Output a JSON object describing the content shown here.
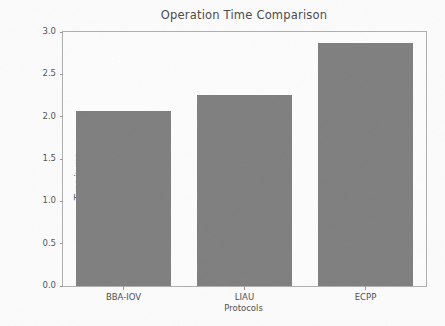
{
  "chart_data": {
    "type": "bar",
    "title": "Operation Time Comparison",
    "xlabel": "Protocols",
    "ylabel": "Time in ms",
    "categories": [
      "BBA-IOV",
      "LIAU",
      "ECPP"
    ],
    "values": [
      2.07,
      2.26,
      2.87
    ],
    "ylim": [
      0.0,
      3.0
    ],
    "yticks": [
      0.0,
      0.5,
      1.0,
      1.5,
      2.0,
      2.5,
      3.0
    ],
    "ytick_labels": [
      "0.0",
      "0.5",
      "1.0",
      "1.5",
      "2.0",
      "2.5",
      "3.0"
    ],
    "grid": false,
    "legend": false,
    "bar_color": "#808080",
    "axis_color": "#b0b0b0",
    "background_color": "#ffffff",
    "text_color": "#4f4f4f"
  }
}
